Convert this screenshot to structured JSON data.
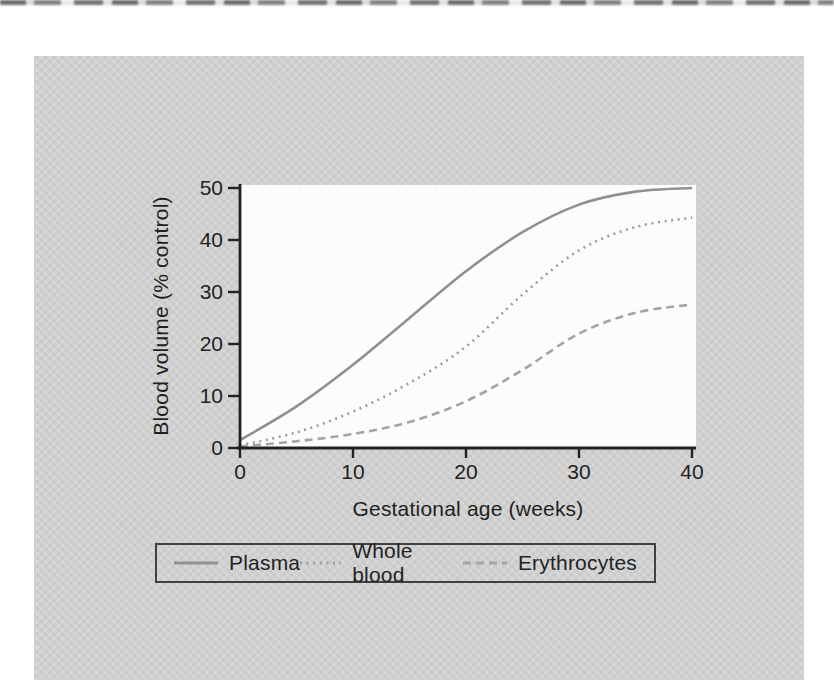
{
  "colors": {
    "page_bg": "#ffffff",
    "panel_bg": "#d3d3d3",
    "plot_bg": "#fcfcfc",
    "axis": "#222222",
    "text": "#1f1f1f",
    "legend_border": "#3e4042"
  },
  "chart_data": {
    "type": "line",
    "title": "",
    "xlabel": "Gestational age (weeks)",
    "ylabel": "Blood volume (% control)",
    "xlim": [
      0,
      40
    ],
    "ylim": [
      0,
      50
    ],
    "x_ticks": [
      0,
      10,
      20,
      30,
      40
    ],
    "x_tick_labels": [
      "0",
      "10",
      "20",
      "30",
      "40"
    ],
    "y_ticks": [
      0,
      10,
      20,
      30,
      40,
      50
    ],
    "y_tick_labels": [
      "0",
      "10",
      "20",
      "30",
      "40",
      "50"
    ],
    "grid": false,
    "legend_position": "bottom",
    "x": [
      0,
      5,
      10,
      15,
      20,
      25,
      30,
      35,
      40
    ],
    "series": [
      {
        "name": "Plasma",
        "style": "solid",
        "color": "#8e9193",
        "values": [
          1.5,
          8,
          16,
          25,
          34,
          41.5,
          46.8,
          49.3,
          50
        ]
      },
      {
        "name": "Whole blood",
        "style": "dotted",
        "color": "#9a9da0",
        "values": [
          0.5,
          3,
          7,
          12.5,
          19.5,
          29.5,
          38,
          42.5,
          44.3
        ]
      },
      {
        "name": "Erythrocytes",
        "style": "dashed",
        "color": "#a1a5a7",
        "values": [
          0.3,
          1.3,
          2.7,
          5,
          9,
          15,
          22,
          26,
          27.6
        ]
      }
    ]
  }
}
